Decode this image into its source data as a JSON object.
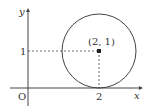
{
  "diagram": {
    "type": "coordinate-plane",
    "axes": {
      "x_label": "x",
      "y_label": "y",
      "origin_label": "O"
    },
    "ticks": {
      "x": [
        {
          "value": 2,
          "label": "2"
        }
      ],
      "y": [
        {
          "value": 1,
          "label": "1"
        }
      ]
    },
    "circle": {
      "center": [
        2,
        1
      ],
      "radius": 1,
      "center_label": "(2, 1)"
    },
    "colors": {
      "stroke": "#444444",
      "text": "#333333",
      "background": "#ffffff"
    }
  }
}
